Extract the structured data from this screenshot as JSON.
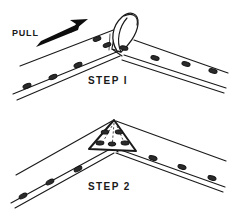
{
  "figure": {
    "background_color": "#ffffff",
    "ink_color": "#1a1a1a",
    "width": 235,
    "height": 213,
    "style": "black-and-white line art technical illustration"
  },
  "panels": [
    {
      "id": "step-1",
      "caption": "STEP I",
      "caption_x": 88,
      "caption_y": 84,
      "description": "V-shaped riveted strap joint with the apex material pulled up into a standing loop",
      "annotation": {
        "label": "PULL",
        "label_x": 12,
        "label_y": 36,
        "arrow_direction": "up-right"
      },
      "rivets_left_upper": [
        {
          "cx": 97,
          "cy": 39
        },
        {
          "cx": 107,
          "cy": 45
        }
      ],
      "rivets_left_lower": [
        {
          "cx": 27,
          "cy": 86
        },
        {
          "cx": 53,
          "cy": 77
        },
        {
          "cx": 78,
          "cy": 65
        }
      ],
      "rivets_right": [
        {
          "cx": 124,
          "cy": 48
        },
        {
          "cx": 155,
          "cy": 58
        },
        {
          "cx": 186,
          "cy": 64
        },
        {
          "cx": 213,
          "cy": 71
        }
      ]
    },
    {
      "id": "step-2",
      "caption": "STEP 2",
      "caption_x": 88,
      "caption_y": 190,
      "description": "Same V-joint with the loop flattened into a triangular gusset plate and riveted down",
      "gusset_rivets_upper": [
        {
          "cx": 105,
          "cy": 132
        },
        {
          "cx": 117,
          "cy": 132
        }
      ],
      "gusset_rivets_lower": [
        {
          "cx": 100,
          "cy": 143
        },
        {
          "cx": 112,
          "cy": 144
        },
        {
          "cx": 124,
          "cy": 143
        }
      ],
      "rivets_left": [
        {
          "cx": 23,
          "cy": 196
        },
        {
          "cx": 50,
          "cy": 182
        },
        {
          "cx": 78,
          "cy": 169
        }
      ],
      "rivets_right": [
        {
          "cx": 153,
          "cy": 158
        },
        {
          "cx": 182,
          "cy": 167
        },
        {
          "cx": 212,
          "cy": 178
        }
      ]
    }
  ],
  "legend": {
    "rivet_label": "rivet",
    "gusset_label": "gusset plate",
    "loop_label": "pulled loop"
  }
}
